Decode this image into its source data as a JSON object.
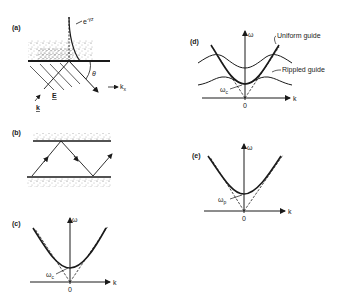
{
  "panels": {
    "a": {
      "label": "(a)",
      "decay_label": "e",
      "decay_exponent": "-γz",
      "angle_label": "θ",
      "kx_label": "k",
      "kx_sub": "x",
      "k_label": "k",
      "E_label": "E"
    },
    "b": {
      "label": "(b)"
    },
    "c": {
      "label": "(c)",
      "omega_label": "ω",
      "k_label": "k",
      "origin_label": "0",
      "cutoff_label": "ω",
      "cutoff_sub": "c"
    },
    "d": {
      "label": "(d)",
      "omega_label": "ω",
      "k_label": "k",
      "origin_label": "0",
      "cutoff_label": "ω",
      "cutoff_sub": "c",
      "uniform_label": "Uniform guide",
      "rippled_label": "Rippled guide"
    },
    "e": {
      "label": "(e)",
      "omega_label": "ω",
      "k_label": "k",
      "origin_label": "0",
      "cutoff_label": "ω",
      "cutoff_sub": "p"
    }
  }
}
